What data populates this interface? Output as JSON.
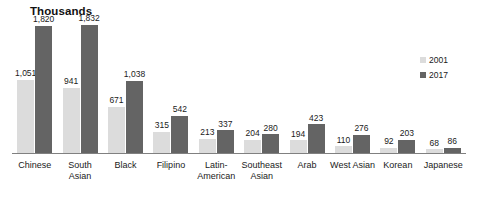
{
  "chart_data": {
    "type": "bar",
    "title": "Thousands",
    "xlabel": "",
    "ylabel": "",
    "ylim": [
      0,
      1900
    ],
    "grid": false,
    "legend_position": "top-right",
    "categories": [
      "Chinese",
      "South Asian",
      "Black",
      "Filipino",
      "Latin-American",
      "Southeast Asian",
      "Arab",
      "West Asian",
      "Korean",
      "Japanese"
    ],
    "category_lines": [
      [
        "Chinese"
      ],
      [
        "South",
        "Asian"
      ],
      [
        "Black"
      ],
      [
        "Filipino"
      ],
      [
        "Latin-",
        "American"
      ],
      [
        "Southeast",
        "Asian"
      ],
      [
        "Arab"
      ],
      [
        "West Asian"
      ],
      [
        "Korean"
      ],
      [
        "Japanese"
      ]
    ],
    "series": [
      {
        "name": "2001",
        "color": "#dcdcdc",
        "values": [
          1051,
          941,
          671,
          315,
          213,
          204,
          194,
          110,
          92,
          68
        ],
        "labels": [
          "1,051",
          "941",
          "671",
          "315",
          "213",
          "204",
          "194",
          "110",
          "92",
          "68"
        ]
      },
      {
        "name": "2017",
        "color": "#646464",
        "values": [
          1820,
          1832,
          1038,
          542,
          337,
          280,
          423,
          276,
          203,
          86
        ],
        "labels": [
          "1,820",
          "1,832",
          "1,038",
          "542",
          "337",
          "280",
          "423",
          "276",
          "203",
          "86"
        ]
      }
    ]
  },
  "legend": {
    "items": [
      {
        "label": "2001",
        "color": "#dcdcdc"
      },
      {
        "label": "2017",
        "color": "#646464"
      }
    ]
  },
  "colors": {
    "series_2001": "#dcdcdc",
    "series_2017": "#646464",
    "axis": "#808080",
    "text": "#1a1a1a",
    "background": "#ffffff"
  }
}
